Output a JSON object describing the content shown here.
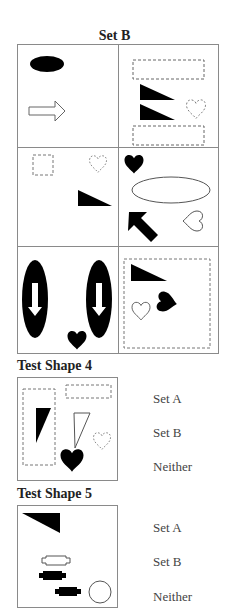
{
  "set_b": {
    "title": "Set B",
    "cells": [
      {
        "shapes": [
          "black-ellipse",
          "hollow-right-arrow"
        ]
      },
      {
        "shapes": [
          "dashed-rectangle",
          "black-right-triangle",
          "black-right-triangle",
          "dashed-heart",
          "dashed-rectangle"
        ]
      },
      {
        "shapes": [
          "dashed-square",
          "dashed-heart",
          "black-right-triangle"
        ]
      },
      {
        "shapes": [
          "black-heart",
          "outline-ellipse",
          "black-up-left-arrow",
          "outline-heart"
        ]
      },
      {
        "shapes": [
          "black-ellipse-with-down-arrow",
          "black-ellipse-with-down-arrow",
          "black-heart"
        ]
      },
      {
        "shapes": [
          "dashed-square",
          "black-right-triangle",
          "outline-heart",
          "black-heart"
        ]
      }
    ]
  },
  "questions": [
    {
      "label": "Test Shape 4",
      "shapes": [
        "dashed-rectangle",
        "dashed-rectangle",
        "black-triangle",
        "outline-triangle",
        "dashed-heart",
        "black-heart"
      ],
      "options": [
        "Set A",
        "Set B",
        "Neither"
      ]
    },
    {
      "label": "Test Shape 5",
      "shapes": [
        "black-triangle",
        "outline-rounded-bar",
        "black-rounded-bar",
        "black-rounded-bar",
        "outline-circle"
      ],
      "options": [
        "Set A",
        "Set B",
        "Neither"
      ]
    }
  ],
  "colors": {
    "border": "#8a8a8a",
    "fill": "#000000",
    "option_text": "#444444"
  }
}
